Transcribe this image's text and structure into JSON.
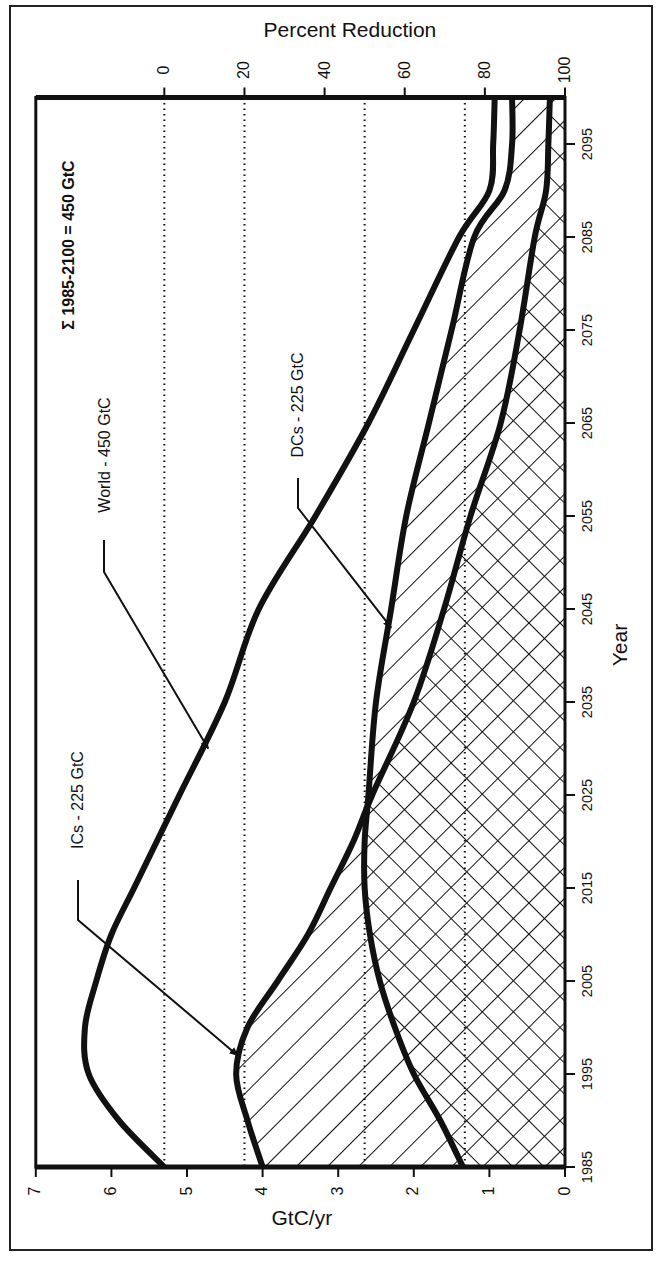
{
  "chart_data": {
    "type": "area",
    "orientation": "rotated-90 (years run vertically bottom-to-top, emissions horizontally right-to-left)",
    "title": "",
    "xlabel": "Year",
    "ylabel": "GtC/yr",
    "secondary_axis_label": "Percent Reduction",
    "x_ticks": [
      1985,
      1995,
      2005,
      2015,
      2025,
      2035,
      2045,
      2055,
      2065,
      2075,
      2085,
      2095
    ],
    "y_ticks": [
      0,
      1,
      2,
      3,
      4,
      5,
      6,
      7
    ],
    "secondary_ticks": [
      0,
      20,
      40,
      60,
      80,
      100
    ],
    "xlim": [
      1985,
      2100
    ],
    "ylim": [
      0,
      7
    ],
    "reference_lines_percent_reduction": [
      0,
      20,
      50,
      75
    ],
    "x": [
      1985,
      1990,
      1995,
      2000,
      2005,
      2010,
      2015,
      2020,
      2025,
      2035,
      2045,
      2055,
      2065,
      2075,
      2085,
      2090,
      2095,
      2100
    ],
    "series": [
      {
        "name": "World - 450 GtC",
        "values": [
          5.3,
          5.9,
          6.3,
          6.35,
          6.2,
          6.0,
          5.7,
          5.4,
          5.1,
          4.5,
          4.05,
          3.3,
          2.6,
          2.0,
          1.4,
          1.0,
          0.95,
          0.93
        ]
      },
      {
        "name": "ICs - 225 GtC",
        "values": [
          4.0,
          4.2,
          4.35,
          4.2,
          3.8,
          3.4,
          3.1,
          2.8,
          2.55,
          2.0,
          1.6,
          1.25,
          0.85,
          0.6,
          0.4,
          0.25,
          0.22,
          0.2
        ]
      },
      {
        "name": "DCs - 225 GtC",
        "values": [
          1.35,
          1.65,
          2.0,
          2.25,
          2.45,
          2.58,
          2.65,
          2.65,
          2.6,
          2.5,
          2.3,
          2.1,
          1.8,
          1.5,
          1.2,
          0.8,
          0.7,
          0.7
        ]
      }
    ],
    "annotations": [
      "Σ 1985-2100 = 450 GtC",
      "World - 450 GtC",
      "ICs - 225 GtC",
      "DCs - 225 GtC"
    ],
    "fills": {
      "ICs_minus_DCs": "single diagonal hatch",
      "common_area": "cross hatch"
    },
    "grid": false,
    "legend": "none (inline labels with arrows)"
  },
  "labels": {
    "percent_reduction": "Percent Reduction",
    "gtc_per_yr": "GtC/yr",
    "year": "Year",
    "sum_note": "Σ 1985-2100 = 450 GtC",
    "world": "World - 450 GtC",
    "ics": "ICs - 225 GtC",
    "dcs": "DCs - 225 GtC"
  },
  "ticks": {
    "percent": [
      "0",
      "20",
      "40",
      "60",
      "80",
      "100"
    ],
    "gtc": [
      "7",
      "6",
      "5",
      "4",
      "3",
      "2",
      "1",
      "0"
    ],
    "years": [
      "1985",
      "1995",
      "2005",
      "2015",
      "2025",
      "2035",
      "2045",
      "2055",
      "2065",
      "2075",
      "2085",
      "2095"
    ]
  },
  "colors": {
    "ink": "#111111",
    "background": "#ffffff"
  }
}
